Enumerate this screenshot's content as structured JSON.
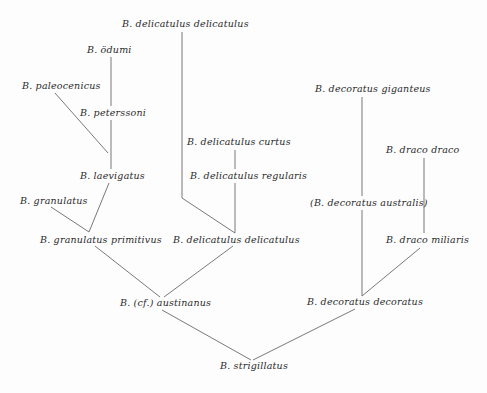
{
  "diagram": {
    "type": "phylogenetic-tree",
    "nodes": [
      {
        "id": "n1",
        "label": "B. delicatulus delicatulus",
        "x": 122,
        "y": 18
      },
      {
        "id": "n2",
        "label": "B. ödumi",
        "x": 87,
        "y": 44
      },
      {
        "id": "n3",
        "label": "B. paleocenicus",
        "x": 22,
        "y": 80
      },
      {
        "id": "n4",
        "label": "B. peterssoni",
        "x": 80,
        "y": 107
      },
      {
        "id": "n5",
        "label": "B. laevigatus",
        "x": 80,
        "y": 170
      },
      {
        "id": "n6",
        "label": "B. granulatus",
        "x": 20,
        "y": 195
      },
      {
        "id": "n7",
        "label": "B. granulatus primitivus",
        "x": 40,
        "y": 234
      },
      {
        "id": "n8",
        "label": "B. delicatulus curtus",
        "x": 187,
        "y": 136
      },
      {
        "id": "n9",
        "label": "B. delicatulus regularis",
        "x": 190,
        "y": 170
      },
      {
        "id": "n10",
        "label": "B. delicatulus delicatulus",
        "x": 173,
        "y": 234
      },
      {
        "id": "n11",
        "label": "B. (cf.) austinanus",
        "x": 120,
        "y": 297
      },
      {
        "id": "n12",
        "label": "B. decoratus giganteus",
        "x": 315,
        "y": 83
      },
      {
        "id": "n13",
        "label": "B. draco draco",
        "x": 386,
        "y": 144
      },
      {
        "id": "n14",
        "label": "(B. decoratus australis)",
        "x": 310,
        "y": 197
      },
      {
        "id": "n15",
        "label": "B. draco miliaris",
        "x": 386,
        "y": 234
      },
      {
        "id": "n16",
        "label": "B. decoratus decoratus",
        "x": 307,
        "y": 296
      },
      {
        "id": "n17",
        "label": "B. strigillatus",
        "x": 220,
        "y": 360
      }
    ],
    "edges": [
      {
        "from": "n2",
        "to": "n4",
        "x1": 111,
        "y1": 57,
        "x2": 111,
        "y2": 106
      },
      {
        "from": "n4",
        "to": "n5",
        "x1": 111,
        "y1": 120,
        "x2": 111,
        "y2": 169
      },
      {
        "from": "n3",
        "to": "n5",
        "x1": 55,
        "y1": 93,
        "x2": 108,
        "y2": 153
      },
      {
        "from": "n5",
        "to": "n7",
        "x1": 109,
        "y1": 183,
        "x2": 89,
        "y2": 232
      },
      {
        "from": "n6",
        "to": "n7",
        "x1": 51,
        "y1": 207,
        "x2": 89,
        "y2": 232
      },
      {
        "from": "n1",
        "to": "n10",
        "x1": 182,
        "y1": 32,
        "x2": 182,
        "y2": 198
      },
      {
        "from": "n1",
        "to": "n10b",
        "x1": 182,
        "y1": 198,
        "x2": 235,
        "y2": 233
      },
      {
        "from": "n8",
        "to": "n9",
        "x1": 235,
        "y1": 150,
        "x2": 235,
        "y2": 169
      },
      {
        "from": "n9",
        "to": "n10",
        "x1": 235,
        "y1": 183,
        "x2": 235,
        "y2": 233
      },
      {
        "from": "n7",
        "to": "n11",
        "x1": 95,
        "y1": 246,
        "x2": 160,
        "y2": 297
      },
      {
        "from": "n10",
        "to": "n11",
        "x1": 233,
        "y1": 246,
        "x2": 164,
        "y2": 297
      },
      {
        "from": "n12",
        "to": "n14",
        "x1": 362,
        "y1": 97,
        "x2": 362,
        "y2": 196
      },
      {
        "from": "n14",
        "to": "n16",
        "x1": 362,
        "y1": 210,
        "x2": 362,
        "y2": 296
      },
      {
        "from": "n13",
        "to": "n15",
        "x1": 424,
        "y1": 158,
        "x2": 424,
        "y2": 233
      },
      {
        "from": "n15",
        "to": "n16",
        "x1": 420,
        "y1": 248,
        "x2": 362,
        "y2": 296
      },
      {
        "from": "n11",
        "to": "n17",
        "x1": 162,
        "y1": 310,
        "x2": 251,
        "y2": 360
      },
      {
        "from": "n16",
        "to": "n17",
        "x1": 355,
        "y1": 309,
        "x2": 253,
        "y2": 360
      }
    ]
  }
}
